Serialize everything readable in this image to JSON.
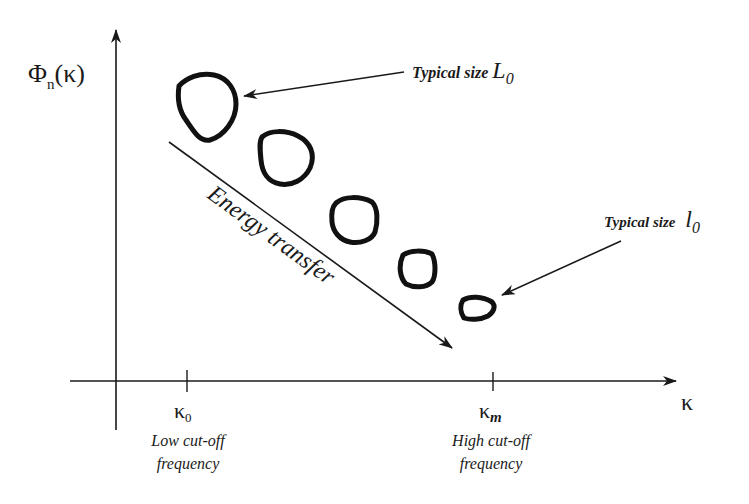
{
  "diagram": {
    "type": "turbulence-energy-cascade",
    "y_axis": {
      "label_main": "Φ",
      "label_sub": "n",
      "label_arg": "(κ)"
    },
    "x_axis": {
      "label": "κ"
    },
    "ticks": [
      {
        "symbol": "κ",
        "subscript": "0",
        "caption_line1": "Low cut-off",
        "caption_line2": "frequency"
      },
      {
        "symbol": "κ",
        "subscript": "m",
        "caption_line1": "High cut-off",
        "caption_line2": "frequency"
      }
    ],
    "annotations": {
      "large_eddy": {
        "text": "Typical size ",
        "symbol": "L",
        "subscript": "0"
      },
      "small_eddy": {
        "text": "Typical size ",
        "symbol": "l",
        "subscript": "0"
      },
      "cascade_arrow": "Energy transfer"
    },
    "eddies": [
      {
        "name": "eddy-1",
        "size": "largest"
      },
      {
        "name": "eddy-2",
        "size": "large"
      },
      {
        "name": "eddy-3",
        "size": "medium"
      },
      {
        "name": "eddy-4",
        "size": "small"
      },
      {
        "name": "eddy-5",
        "size": "smallest"
      }
    ],
    "colors": {
      "ink": "#1a1a1a",
      "background": "#ffffff"
    }
  }
}
